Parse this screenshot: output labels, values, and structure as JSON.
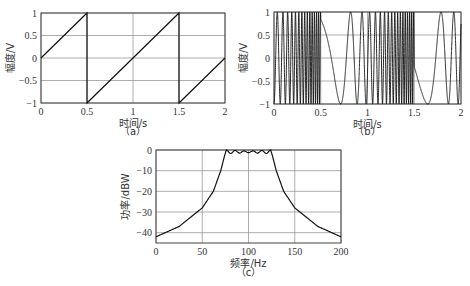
{
  "chart_data": [
    {
      "id": "a",
      "type": "line",
      "caption": "（a）",
      "title": "",
      "xlabel": "时间/s",
      "ylabel": "幅度/V",
      "xlim": [
        0,
        2
      ],
      "ylim": [
        -1,
        1
      ],
      "xticks": [
        "0",
        "0.5",
        "1",
        "1.5",
        "2"
      ],
      "yticks": [
        "1",
        "0.5",
        "0",
        "-0.5",
        "-1"
      ],
      "grid": true,
      "description": "Sawtooth waveform, period 1 s, rising from -1 to 1",
      "x": [
        0,
        0.5,
        0.5,
        1.5,
        1.5,
        2
      ],
      "y": [
        0,
        1,
        -1,
        1,
        -1,
        0
      ]
    },
    {
      "id": "b",
      "type": "line",
      "caption": "（b）",
      "title": "",
      "xlabel": "时间/s",
      "ylabel": "幅度/V",
      "xlim": [
        0,
        2
      ],
      "ylim": [
        -1,
        1
      ],
      "xticks": [
        "0",
        "0.5",
        "1",
        "1.5",
        "2"
      ],
      "yticks": [
        "1",
        "0.5",
        "0",
        "-0.5",
        "-1"
      ],
      "grid": true,
      "description": "Sawtooth-modulated FM (chirp) signal, amplitude ±1; slowest oscillation near t=0.5 s and t=1.5 s, densest just before them"
    },
    {
      "id": "c",
      "type": "line",
      "caption": "（c）",
      "title": "",
      "xlabel": "频率/Hz",
      "ylabel": "功率/dBW",
      "xlim": [
        0,
        200
      ],
      "ylim": [
        -45,
        0
      ],
      "xticks": [
        "0",
        "50",
        "100",
        "150",
        "200"
      ],
      "yticks": [
        "0",
        "-10",
        "-20",
        "-30",
        "-40"
      ],
      "grid": true,
      "description": "Power spectrum, flat passband ~75–125 Hz with small ripple near 0 dBW",
      "x": [
        0,
        25,
        50,
        62,
        70,
        74,
        76,
        100,
        124,
        126,
        130,
        138,
        150,
        175,
        200
      ],
      "y": [
        -42,
        -37,
        -28,
        -20,
        -10,
        -3,
        0,
        -1,
        0,
        -3,
        -10,
        -20,
        -28,
        -37,
        -42
      ]
    }
  ]
}
